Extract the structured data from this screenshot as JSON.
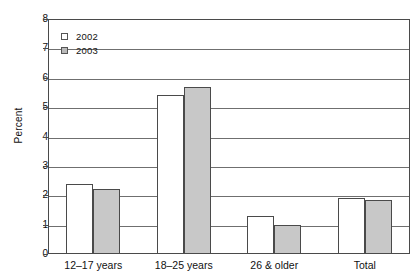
{
  "chart_data": {
    "type": "bar",
    "title": "",
    "xlabel": "",
    "ylabel": "Percent",
    "ylim": [
      0,
      8
    ],
    "yticks": [
      "0",
      "1",
      "2",
      "3",
      "4",
      "5",
      "6",
      "7",
      "8"
    ],
    "grid": true,
    "legend_position": "top-left-inside",
    "categories": [
      "12–17 years",
      "18–25 years",
      "26 & older",
      "Total"
    ],
    "series": [
      {
        "name": "2002",
        "color": "#ffffff",
        "values": [
          2.4,
          5.4,
          1.3,
          1.9
        ]
      },
      {
        "name": "2003",
        "color": "#c8c8c8",
        "values": [
          2.2,
          5.7,
          1.0,
          1.85
        ]
      }
    ]
  },
  "colors": {
    "series_2002_fill": "#ffffff",
    "series_2003_fill": "#c8c8c8",
    "outline": "#4a4a4a",
    "gridline": "#6f6f6f",
    "text": "#111111",
    "background": "#ffffff"
  }
}
